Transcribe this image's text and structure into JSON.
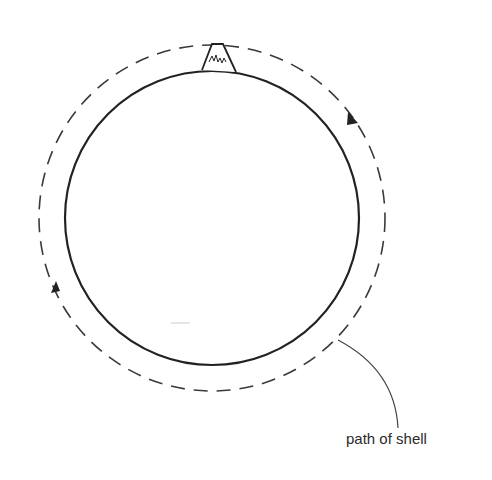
{
  "diagram": {
    "type": "orbit illustration",
    "planet": {
      "shape": "circle",
      "stroke": "solid"
    },
    "mountain": {
      "position": "top of planet"
    },
    "orbit": {
      "stroke": "dashed",
      "direction": "clockwise"
    },
    "annotation": {
      "label": "path of shell"
    }
  },
  "colors": {
    "line": "#2a2a2a",
    "background": "#ffffff"
  }
}
